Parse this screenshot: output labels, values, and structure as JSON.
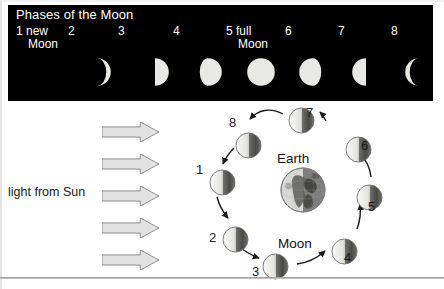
{
  "panel": {
    "title": "Phases of the Moon",
    "phases": [
      {
        "num": "1",
        "name": "new\nMoon",
        "shape": "new",
        "x": 8,
        "disc_x": 14
      },
      {
        "num": "2",
        "name": "",
        "shape": "waxing-crescent",
        "x": 60,
        "disc_x": 74
      },
      {
        "num": "3",
        "name": "",
        "shape": "first-quarter",
        "x": 110,
        "disc_x": 132
      },
      {
        "num": "4",
        "name": "",
        "shape": "waxing-gibbous",
        "x": 165,
        "disc_x": 185
      },
      {
        "num": "5",
        "name": "full\nMoon",
        "shape": "full",
        "x": 218,
        "disc_x": 238
      },
      {
        "num": "6",
        "name": "",
        "shape": "waning-gibbous",
        "x": 277,
        "disc_x": 290
      },
      {
        "num": "7",
        "name": "",
        "shape": "last-quarter",
        "x": 330,
        "disc_x": 343
      },
      {
        "num": "8",
        "name": "",
        "shape": "waning-crescent",
        "x": 383,
        "disc_x": 396
      }
    ]
  },
  "diagram": {
    "sun_label": "light from Sun",
    "earth_label": "Earth",
    "moon_label": "Moon",
    "arrow_count": 5,
    "arrow_tops": [
      20,
      52,
      84,
      116,
      148
    ],
    "orbit_moons": [
      {
        "num": "1",
        "mx": 209,
        "my": 68,
        "nx": 196,
        "ny": 62
      },
      {
        "num": "2",
        "mx": 222,
        "my": 125,
        "nx": 209,
        "ny": 130
      },
      {
        "num": "3",
        "mx": 262,
        "my": 152,
        "nx": 252,
        "ny": 164
      },
      {
        "num": "4",
        "mx": 331,
        "my": 137,
        "nx": 344,
        "ny": 150
      },
      {
        "num": "5",
        "mx": 356,
        "my": 83,
        "nx": 368,
        "ny": 99
      },
      {
        "num": "6",
        "mx": 345,
        "my": 35,
        "nx": 361,
        "ny": 38
      },
      {
        "num": "7",
        "mx": 288,
        "my": 6,
        "nx": 306,
        "ny": 5
      },
      {
        "num": "8",
        "mx": 235,
        "my": 31,
        "nx": 229,
        "ny": 15
      }
    ]
  },
  "colors": {
    "panel_bg": "#000000",
    "panel_text": "#ffffff",
    "moon_lit": "#e8e8e4",
    "moon_dark": "#4a4a4a",
    "arrow_fill": "#e2e2e2",
    "arrow_stroke": "#8d8d8d",
    "diagram_text": "#1a1a1a"
  }
}
